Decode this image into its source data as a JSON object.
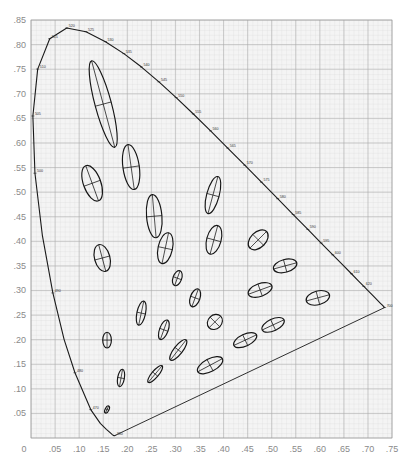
{
  "chart_data": {
    "type": "scatter",
    "title": "",
    "subtitle": "",
    "xlabel": "",
    "ylabel": "",
    "xlim": [
      0,
      0.75
    ],
    "ylim": [
      0,
      0.85
    ],
    "grid": true,
    "legend": null,
    "x_ticks": [
      "0",
      ".05",
      ".10",
      ".15",
      ".20",
      ".25",
      ".30",
      ".35",
      ".40",
      ".45",
      ".50",
      ".55",
      ".60",
      ".65",
      ".70",
      ".75"
    ],
    "y_ticks": [
      ".05",
      ".10",
      ".15",
      ".20",
      ".25",
      ".30",
      ".35",
      ".40",
      ".45",
      ".50",
      ".55",
      ".60",
      ".65",
      ".70",
      ".75",
      ".80",
      ".85"
    ],
    "spectral_locus": {
      "description": "Horseshoe-shaped spectral locus boundary with line of purples",
      "points": [
        [
          0.1741,
          0.005
        ],
        [
          0.1738,
          0.0049
        ],
        [
          0.1733,
          0.0048
        ],
        [
          0.1726,
          0.0048
        ],
        [
          0.1714,
          0.0051
        ],
        [
          0.1689,
          0.0069
        ],
        [
          0.1644,
          0.0109
        ],
        [
          0.1566,
          0.0177
        ],
        [
          0.144,
          0.0297
        ],
        [
          0.1241,
          0.0578
        ],
        [
          0.0913,
          0.1327
        ],
        [
          0.0687,
          0.2007
        ],
        [
          0.0454,
          0.295
        ],
        [
          0.0235,
          0.4127
        ],
        [
          0.0082,
          0.5384
        ],
        [
          0.0039,
          0.6548
        ],
        [
          0.0139,
          0.7502
        ],
        [
          0.0389,
          0.812
        ],
        [
          0.0743,
          0.8338
        ],
        [
          0.1142,
          0.8262
        ],
        [
          0.1547,
          0.8059
        ],
        [
          0.1929,
          0.7816
        ],
        [
          0.2296,
          0.7543
        ],
        [
          0.2658,
          0.7243
        ],
        [
          0.3016,
          0.6923
        ],
        [
          0.3373,
          0.6589
        ],
        [
          0.3731,
          0.6245
        ],
        [
          0.4087,
          0.5896
        ],
        [
          0.4441,
          0.5547
        ],
        [
          0.4788,
          0.5202
        ],
        [
          0.5125,
          0.4866
        ],
        [
          0.5448,
          0.4544
        ],
        [
          0.5752,
          0.4242
        ],
        [
          0.6029,
          0.3965
        ],
        [
          0.627,
          0.3725
        ],
        [
          0.6482,
          0.3514
        ],
        [
          0.6658,
          0.334
        ],
        [
          0.6801,
          0.3197
        ],
        [
          0.6915,
          0.3083
        ],
        [
          0.7006,
          0.2993
        ],
        [
          0.7079,
          0.292
        ],
        [
          0.714,
          0.2859
        ],
        [
          0.719,
          0.2809
        ],
        [
          0.723,
          0.277
        ],
        [
          0.726,
          0.274
        ],
        [
          0.7283,
          0.2717
        ],
        [
          0.73,
          0.27
        ],
        [
          0.7311,
          0.2689
        ],
        [
          0.732,
          0.268
        ],
        [
          0.7327,
          0.2673
        ],
        [
          0.7334,
          0.2666
        ],
        [
          0.734,
          0.266
        ],
        [
          0.7344,
          0.2656
        ],
        [
          0.7346,
          0.2654
        ],
        [
          0.7347,
          0.2653
        ]
      ],
      "line_of_purples": [
        [
          0.1741,
          0.005
        ],
        [
          0.7347,
          0.2653
        ]
      ]
    },
    "wavelength_labels": [
      {
        "label": "380",
        "x": 0.1741,
        "y": 0.005
      },
      {
        "label": "470",
        "x": 0.1241,
        "y": 0.0578
      },
      {
        "label": "480",
        "x": 0.0913,
        "y": 0.1327
      },
      {
        "label": "490",
        "x": 0.0454,
        "y": 0.295
      },
      {
        "label": "500",
        "x": 0.0082,
        "y": 0.5384
      },
      {
        "label": "505",
        "x": 0.0039,
        "y": 0.6548
      },
      {
        "label": "510",
        "x": 0.0139,
        "y": 0.7502
      },
      {
        "label": "515",
        "x": 0.0389,
        "y": 0.812
      },
      {
        "label": "520",
        "x": 0.0743,
        "y": 0.8338
      },
      {
        "label": "525",
        "x": 0.1142,
        "y": 0.8262
      },
      {
        "label": "530",
        "x": 0.1547,
        "y": 0.8059
      },
      {
        "label": "535",
        "x": 0.1929,
        "y": 0.7816
      },
      {
        "label": "540",
        "x": 0.2296,
        "y": 0.7543
      },
      {
        "label": "545",
        "x": 0.2658,
        "y": 0.7243
      },
      {
        "label": "550",
        "x": 0.3016,
        "y": 0.6923
      },
      {
        "label": "555",
        "x": 0.3373,
        "y": 0.6589
      },
      {
        "label": "560",
        "x": 0.3731,
        "y": 0.6245
      },
      {
        "label": "565",
        "x": 0.4087,
        "y": 0.5896
      },
      {
        "label": "570",
        "x": 0.4441,
        "y": 0.5547
      },
      {
        "label": "575",
        "x": 0.4788,
        "y": 0.5202
      },
      {
        "label": "580",
        "x": 0.5125,
        "y": 0.4866
      },
      {
        "label": "585",
        "x": 0.5448,
        "y": 0.4544
      },
      {
        "label": "590",
        "x": 0.5752,
        "y": 0.4242
      },
      {
        "label": "595",
        "x": 0.6029,
        "y": 0.3965
      },
      {
        "label": "600",
        "x": 0.627,
        "y": 0.3725
      },
      {
        "label": "610",
        "x": 0.6658,
        "y": 0.334
      },
      {
        "label": "620",
        "x": 0.6915,
        "y": 0.3083
      },
      {
        "label": "700",
        "x": 0.7347,
        "y": 0.2653
      }
    ],
    "ellipses": [
      {
        "cx": 0.15,
        "cy": 0.679,
        "rx": 0.017,
        "ry": 0.091,
        "angle_deg": -15
      },
      {
        "cx": 0.127,
        "cy": 0.518,
        "rx": 0.018,
        "ry": 0.038,
        "angle_deg": -20
      },
      {
        "cx": 0.208,
        "cy": 0.551,
        "rx": 0.017,
        "ry": 0.046,
        "angle_deg": -8
      },
      {
        "cx": 0.256,
        "cy": 0.451,
        "rx": 0.016,
        "ry": 0.044,
        "angle_deg": -5
      },
      {
        "cx": 0.279,
        "cy": 0.386,
        "rx": 0.015,
        "ry": 0.032,
        "angle_deg": 12
      },
      {
        "cx": 0.148,
        "cy": 0.366,
        "rx": 0.016,
        "ry": 0.028,
        "angle_deg": -15
      },
      {
        "cx": 0.378,
        "cy": 0.494,
        "rx": 0.013,
        "ry": 0.039,
        "angle_deg": 15
      },
      {
        "cx": 0.38,
        "cy": 0.403,
        "rx": 0.015,
        "ry": 0.03,
        "angle_deg": 15
      },
      {
        "cx": 0.304,
        "cy": 0.325,
        "rx": 0.009,
        "ry": 0.016,
        "angle_deg": 20
      },
      {
        "cx": 0.472,
        "cy": 0.403,
        "rx": 0.016,
        "ry": 0.024,
        "angle_deg": 45
      },
      {
        "cx": 0.341,
        "cy": 0.285,
        "rx": 0.01,
        "ry": 0.019,
        "angle_deg": 20
      },
      {
        "cx": 0.528,
        "cy": 0.35,
        "rx": 0.025,
        "ry": 0.013,
        "angle_deg": -15
      },
      {
        "cx": 0.476,
        "cy": 0.301,
        "rx": 0.026,
        "ry": 0.013,
        "angle_deg": -20
      },
      {
        "cx": 0.596,
        "cy": 0.285,
        "rx": 0.025,
        "ry": 0.014,
        "angle_deg": -15
      },
      {
        "cx": 0.229,
        "cy": 0.254,
        "rx": 0.009,
        "ry": 0.025,
        "angle_deg": 12
      },
      {
        "cx": 0.276,
        "cy": 0.22,
        "rx": 0.009,
        "ry": 0.021,
        "angle_deg": 20
      },
      {
        "cx": 0.382,
        "cy": 0.236,
        "rx": 0.017,
        "ry": 0.014,
        "angle_deg": -45
      },
      {
        "cx": 0.158,
        "cy": 0.199,
        "rx": 0.009,
        "ry": 0.016,
        "angle_deg": 0
      },
      {
        "cx": 0.503,
        "cy": 0.23,
        "rx": 0.025,
        "ry": 0.012,
        "angle_deg": -25
      },
      {
        "cx": 0.445,
        "cy": 0.199,
        "rx": 0.026,
        "ry": 0.012,
        "angle_deg": -25
      },
      {
        "cx": 0.306,
        "cy": 0.179,
        "rx": 0.009,
        "ry": 0.026,
        "angle_deg": 38
      },
      {
        "cx": 0.372,
        "cy": 0.148,
        "rx": 0.029,
        "ry": 0.013,
        "angle_deg": -28
      },
      {
        "cx": 0.187,
        "cy": 0.122,
        "rx": 0.007,
        "ry": 0.018,
        "angle_deg": 10
      },
      {
        "cx": 0.258,
        "cy": 0.13,
        "rx": 0.007,
        "ry": 0.022,
        "angle_deg": 40
      },
      {
        "cx": 0.158,
        "cy": 0.058,
        "rx": 0.004,
        "ry": 0.008,
        "angle_deg": 25
      }
    ]
  }
}
